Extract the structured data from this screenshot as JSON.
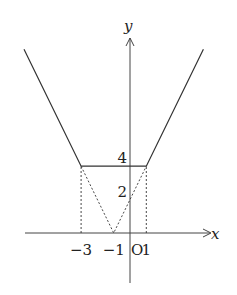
{
  "chart_data": {
    "type": "line",
    "title": "",
    "xlabel": "x",
    "ylabel": "y",
    "origin_label": "O",
    "xlim": [
      -8,
      7.2
    ],
    "ylim": [
      -3.6,
      12.5
    ],
    "x_tick_labels": [
      {
        "value": -3,
        "text": "−3"
      },
      {
        "value": -1,
        "text": "−1"
      },
      {
        "value": 1,
        "text": "1"
      }
    ],
    "y_tick_labels": [
      {
        "value": 4,
        "text": "4"
      },
      {
        "value": 2,
        "text": "2"
      }
    ],
    "series": [
      {
        "name": "y=|x+3|+|x-1|",
        "style": "solid",
        "points": [
          [
            -6.5,
            11
          ],
          [
            -3,
            4
          ],
          [
            1,
            4
          ],
          [
            4.5,
            11
          ]
        ]
      },
      {
        "name": "dashed-v",
        "style": "dashed",
        "points": [
          [
            -3,
            4
          ],
          [
            -1,
            0
          ],
          [
            1,
            4
          ]
        ]
      },
      {
        "name": "dashed-vertical-left",
        "style": "dashed",
        "points": [
          [
            -3,
            0
          ],
          [
            -3,
            4
          ]
        ]
      },
      {
        "name": "dashed-vertical-right",
        "style": "dashed",
        "points": [
          [
            1,
            0
          ],
          [
            1,
            4
          ]
        ]
      }
    ],
    "grid": false,
    "legend": "none"
  },
  "colors": {
    "line": "#333333",
    "axis": "#444444"
  }
}
